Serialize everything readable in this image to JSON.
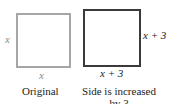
{
  "diagram": {
    "original": {
      "side_left_label": "x",
      "side_bottom_label": "x",
      "caption": "Original",
      "stroke_color": "#a6a6a6"
    },
    "increased": {
      "side_right_label": "x + 3",
      "side_bottom_label": "x + 3",
      "caption_line1": "Side is increased",
      "caption_line2": "by 3",
      "stroke_color": "#3a3a3a"
    }
  }
}
